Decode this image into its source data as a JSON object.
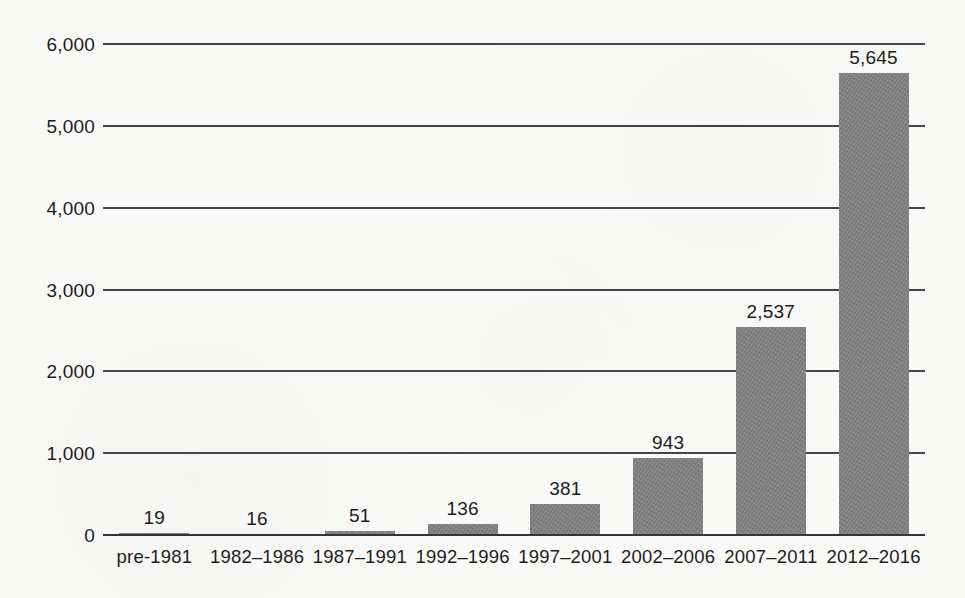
{
  "chart_data": {
    "type": "bar",
    "title": "",
    "xlabel": "",
    "ylabel": "",
    "categories": [
      "pre-1981",
      "1982–1986",
      "1987–1991",
      "1992–1996",
      "1997–2001",
      "2002–2006",
      "2007–2011",
      "2012–2016"
    ],
    "values": [
      19,
      16,
      51,
      136,
      381,
      943,
      2537,
      5645
    ],
    "value_labels": [
      "19",
      "16",
      "51",
      "136",
      "381",
      "943",
      "2,537",
      "5,645"
    ],
    "y_ticks": [
      {
        "value": 0,
        "label": "0"
      },
      {
        "value": 1000,
        "label": "1,000"
      },
      {
        "value": 2000,
        "label": "2,000"
      },
      {
        "value": 3000,
        "label": "3,000"
      },
      {
        "value": 4000,
        "label": "4,000"
      },
      {
        "value": 5000,
        "label": "5,000"
      },
      {
        "value": 6000,
        "label": "6,000"
      }
    ],
    "ylim": [
      0,
      6000
    ],
    "grid": true,
    "legend": "none",
    "bar_color": "#848484",
    "line_color": "#454545",
    "text_color": "#1d1d1d",
    "background_color": "#f9f9f7"
  }
}
